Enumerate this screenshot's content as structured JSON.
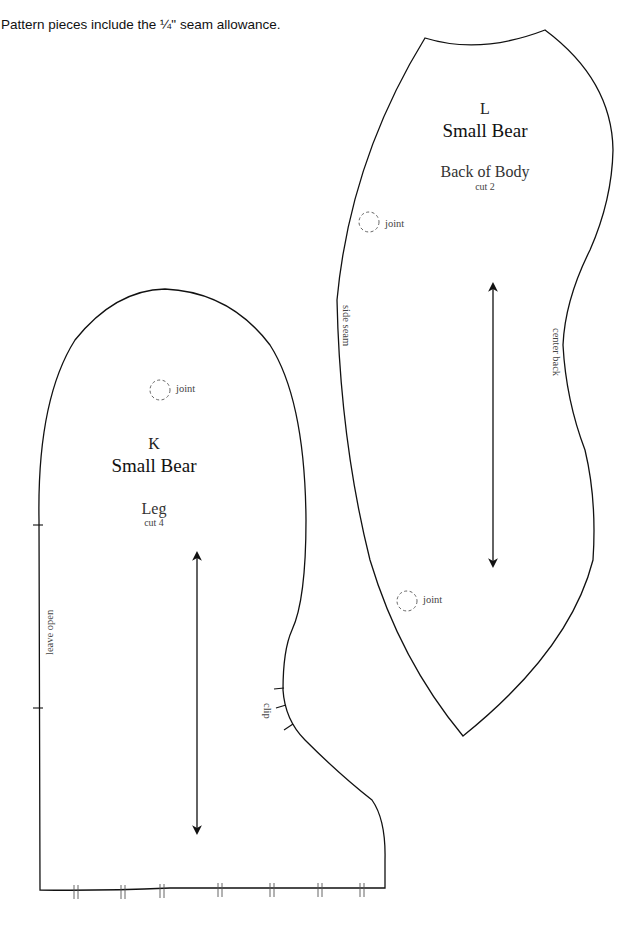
{
  "note": "Pattern pieces include the ¼\" seam allowance.",
  "pieces": {
    "body": {
      "letter": "L",
      "title": "Small Bear",
      "name": "Back of Body",
      "cut": "cut 2",
      "joints": [
        {
          "label": "joint"
        },
        {
          "label": "joint"
        }
      ],
      "side_seam_label": "side seam",
      "center_back_label": "center back"
    },
    "leg": {
      "letter": "K",
      "title": "Small Bear",
      "name": "Leg",
      "cut": "cut 4",
      "joint": {
        "label": "joint"
      },
      "leave_open_label": "leave open",
      "clip_label": "clip"
    }
  },
  "colors": {
    "line": "#111111",
    "joint": "#555555",
    "background": "#ffffff"
  }
}
